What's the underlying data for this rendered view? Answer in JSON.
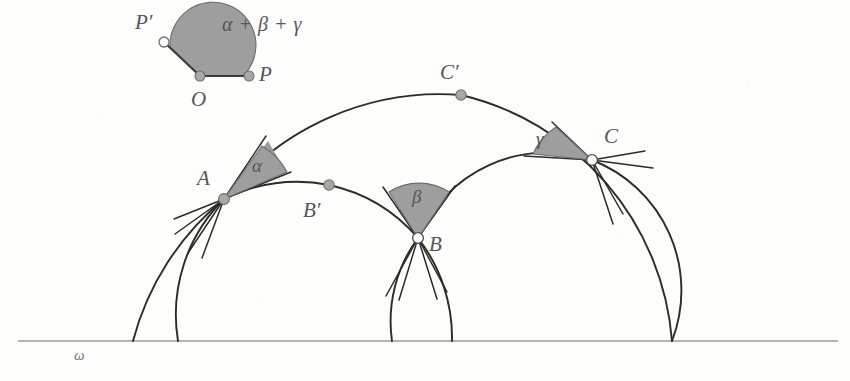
{
  "figure": {
    "title_expression": "α + β + γ",
    "baseline_label": "ω",
    "colors": {
      "ink": "#2b2b2b",
      "label_ink": "#55555a",
      "wedge_fill": "#9e9e9e",
      "wedge_stroke": "#6e6e6e",
      "vertex_fill": "#a8a8a8",
      "vertex_open_fill": "#ffffff",
      "baseline": "#9a9a9a",
      "paper": "#fdfdfb"
    },
    "vertices": [
      {
        "id": "A",
        "label": "A",
        "x": 224,
        "y": 199,
        "label_x": 197,
        "label_y": 166,
        "style": "filled"
      },
      {
        "id": "B",
        "label": "B",
        "x": 418,
        "y": 238,
        "label_x": 429,
        "label_y": 232,
        "style": "open"
      },
      {
        "id": "C",
        "label": "C",
        "x": 592,
        "y": 160,
        "label_x": 604,
        "label_y": 124,
        "style": "open"
      }
    ],
    "midpoints": [
      {
        "id": "Bp",
        "label": "B′",
        "x": 329,
        "y": 185,
        "label_x": 303,
        "label_y": 198
      },
      {
        "id": "Cp",
        "label": "C′",
        "x": 461,
        "y": 95,
        "label_x": 440,
        "label_y": 60
      }
    ],
    "angles": [
      {
        "id": "alpha",
        "label": "α",
        "vertex": "A",
        "label_x": 252,
        "label_y": 155
      },
      {
        "id": "beta",
        "label": "β",
        "vertex": "B",
        "label_x": 412,
        "label_y": 186
      },
      {
        "id": "gamma",
        "label": "γ",
        "vertex": "C",
        "label_x": 536,
        "label_y": 128
      }
    ],
    "baseline": {
      "x1": 18,
      "x2": 838,
      "y": 341,
      "label_x": 74,
      "label_y": 350
    },
    "inset": {
      "points": [
        {
          "id": "O",
          "label": "O",
          "x": 200,
          "y": 76,
          "label_x": 191,
          "label_y": 87,
          "style": "filled"
        },
        {
          "id": "P",
          "label": "P",
          "x": 249,
          "y": 76,
          "label_x": 259,
          "label_y": 62,
          "style": "filled"
        },
        {
          "id": "Pp",
          "label": "P′",
          "x": 164,
          "y": 42,
          "label_x": 135,
          "label_y": 10,
          "style": "open"
        }
      ],
      "expression_x": 222,
      "expression_y": 13
    }
  }
}
